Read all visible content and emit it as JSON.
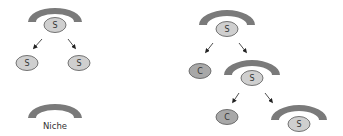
{
  "colors": {
    "niche": "#7a7a7a",
    "stem_cell_fill": "#cfcfcf",
    "committed_cell_fill": "#a8a8a8",
    "cell_stroke": "#555555",
    "arrow": "#222222"
  },
  "left_panel": {
    "parent": {
      "label": "S"
    },
    "daughters": [
      {
        "label": "S"
      },
      {
        "label": "S"
      }
    ],
    "legend": {
      "label": "Niche"
    }
  },
  "right_panel": {
    "parent": {
      "label": "S"
    },
    "level1": [
      {
        "label": "C"
      },
      {
        "label": "S"
      }
    ],
    "level2": [
      {
        "label": "C"
      },
      {
        "label": "S"
      }
    ]
  }
}
